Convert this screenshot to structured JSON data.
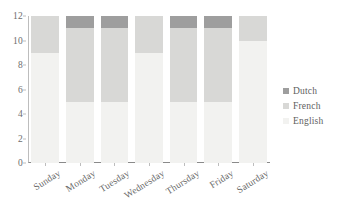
{
  "chart_data": {
    "type": "bar",
    "subtype": "stacked-vertical",
    "title": "",
    "subtitle": "",
    "xlabel": "",
    "ylabel": "",
    "categories": [
      "Sunday",
      "Monday",
      "Tuesday",
      "Wednesday",
      "Thursday",
      "Friday",
      "Saturday"
    ],
    "series": [
      {
        "name": "English",
        "color": "#f2f2f0",
        "values": [
          9,
          5,
          5,
          9,
          5,
          5,
          10
        ]
      },
      {
        "name": "French",
        "color": "#d8d8d6",
        "values": [
          3,
          6,
          6,
          3,
          6,
          6,
          2
        ]
      },
      {
        "name": "Dutch",
        "color": "#9e9e9e",
        "values": [
          0,
          1,
          1,
          0,
          1,
          1,
          0
        ]
      }
    ],
    "stack_totals": [
      12,
      12,
      12,
      12,
      12,
      12,
      12
    ],
    "ylim": [
      0,
      12
    ],
    "y_ticks": [
      0,
      2,
      4,
      6,
      8,
      10,
      12
    ],
    "y_tick_labels": [
      "0",
      "2",
      "4",
      "6",
      "8",
      "10",
      "12"
    ],
    "grid": false,
    "legend_position": "right",
    "legend_order": [
      "Dutch",
      "French",
      "English"
    ],
    "x_label_rotation_deg": -32,
    "axis_color": "#8a8a8a",
    "tick_text_color": "#6d6d6d",
    "background": "#ffffff"
  },
  "legend": {
    "entries": [
      {
        "label": "Dutch",
        "color": "#9e9e9e"
      },
      {
        "label": "French",
        "color": "#d8d8d6"
      },
      {
        "label": "English",
        "color": "#f2f2f0"
      }
    ]
  }
}
